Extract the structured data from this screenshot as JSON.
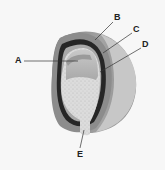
{
  "diagram": {
    "colors": {
      "background": "#f7f7f7",
      "outer_coat": "#8f8f8f",
      "outer_coat_light": "#c4c4c4",
      "dark_layer": "#262626",
      "inner_layer": "#a8a8a8",
      "cavity": "#b9b9b9",
      "speckled_tissue": "#d9d9d9",
      "leader_line": "#333333"
    },
    "labels": [
      {
        "id": "A",
        "text": "A"
      },
      {
        "id": "B",
        "text": "B"
      },
      {
        "id": "C",
        "text": "C"
      },
      {
        "id": "D",
        "text": "D"
      },
      {
        "id": "E",
        "text": "E"
      }
    ]
  }
}
